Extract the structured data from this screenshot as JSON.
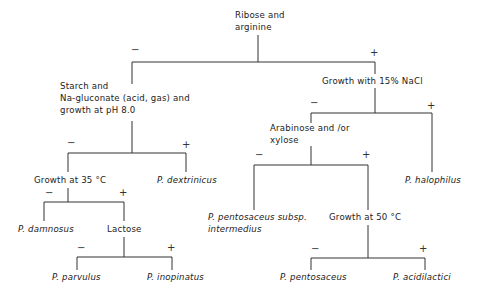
{
  "diagram": {
    "type": "dichotomous identification key (Pediococcus)",
    "nodes": {
      "root": {
        "line1": "Ribose and",
        "line2": "arginine"
      },
      "starch": {
        "line1": "Starch and",
        "line2": "Na-gluconate (acid, gas) and",
        "line3": "growth at pH 8.0"
      },
      "nacl": {
        "label": "Growth with 15% NaCl"
      },
      "growth35": {
        "label": "Growth at 35 °C"
      },
      "dextrinicus": {
        "label": "P. dextrinicus"
      },
      "arabinose": {
        "line1": "Arabinose and /or",
        "line2": "xylose"
      },
      "halophilus": {
        "label": "P. halophilus"
      },
      "damnosus": {
        "label": "P. damnosus"
      },
      "lactose": {
        "label": "Lactose"
      },
      "intermedius": {
        "line1": "P. pentosaceus subsp.",
        "line2": "intermedius"
      },
      "growth50": {
        "label": "Growth at 50 °C"
      },
      "parvulus": {
        "label": "P. parvulus"
      },
      "inopinatus": {
        "label": "P. inopinatus"
      },
      "pentosaceus": {
        "label": "P. pentosaceus"
      },
      "acidilactici": {
        "label": "P. acidilactici"
      }
    },
    "signs": {
      "neg": "−",
      "pos": "+"
    },
    "edges": [
      {
        "from": "Ribose and arginine",
        "sign": "−",
        "to": "Starch and Na-gluconate (acid, gas) and growth at pH 8.0"
      },
      {
        "from": "Ribose and arginine",
        "sign": "+",
        "to": "Growth with 15% NaCl"
      },
      {
        "from": "Starch and Na-gluconate",
        "sign": "−",
        "to": "Growth at 35 °C"
      },
      {
        "from": "Starch and Na-gluconate",
        "sign": "+",
        "to": "P. dextrinicus"
      },
      {
        "from": "Growth at 35 °C",
        "sign": "−",
        "to": "P. damnosus"
      },
      {
        "from": "Growth at 35 °C",
        "sign": "+",
        "to": "Lactose"
      },
      {
        "from": "Lactose",
        "sign": "−",
        "to": "P. parvulus"
      },
      {
        "from": "Lactose",
        "sign": "+",
        "to": "P. inopinatus"
      },
      {
        "from": "Growth with 15% NaCl",
        "sign": "−",
        "to": "Arabinose and /or xylose"
      },
      {
        "from": "Growth with 15% NaCl",
        "sign": "+",
        "to": "P. halophilus"
      },
      {
        "from": "Arabinose and /or xylose",
        "sign": "−",
        "to": "P. pentosaceus subsp. intermedius"
      },
      {
        "from": "Arabinose and /or xylose",
        "sign": "+",
        "to": "Growth at 50 °C"
      },
      {
        "from": "Growth at 50 °C",
        "sign": "−",
        "to": "P. pentosaceus"
      },
      {
        "from": "Growth at 50 °C",
        "sign": "+",
        "to": "P. acidilactici"
      }
    ],
    "line_color": "#333333"
  }
}
